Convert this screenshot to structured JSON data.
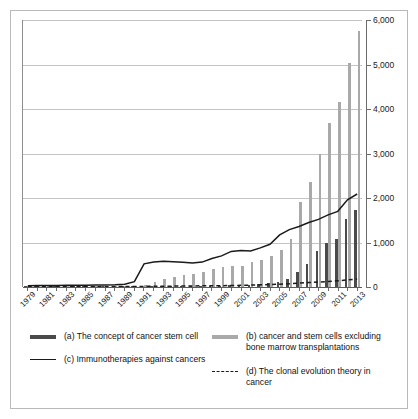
{
  "chart_data": {
    "type": "bar",
    "title": "",
    "subtitle": "",
    "xlabel": "",
    "ylabel": "",
    "ylim": [
      0,
      6000
    ],
    "xlim": [
      1979,
      2013
    ],
    "grid": true,
    "legend_position": "bottom",
    "y_ticks": [
      0,
      1000,
      2000,
      3000,
      4000,
      5000,
      6000
    ],
    "y_tick_labels": [
      "0",
      "1,000",
      "2,000",
      "3,000",
      "4,000",
      "5,000",
      "6,000"
    ],
    "x": [
      1979,
      1980,
      1981,
      1982,
      1983,
      1984,
      1985,
      1986,
      1987,
      1988,
      1989,
      1990,
      1991,
      1992,
      1993,
      1994,
      1995,
      1996,
      1997,
      1998,
      1999,
      2000,
      2001,
      2002,
      2003,
      2004,
      2005,
      2006,
      2007,
      2008,
      2009,
      2010,
      2011,
      2012,
      2013
    ],
    "x_tick_labels": [
      "1979",
      "1981",
      "1983",
      "1985",
      "1987",
      "1989",
      "1991",
      "1993",
      "1995",
      "1997",
      "1999",
      "2001",
      "2003",
      "2005",
      "2007",
      "2009",
      "2011",
      "2013"
    ],
    "series": [
      {
        "key": "a",
        "name": "(a) The concept of cancer stem cell",
        "render": "bar",
        "color": "#4a4a4a",
        "values": [
          2,
          2,
          3,
          3,
          4,
          4,
          5,
          5,
          6,
          7,
          8,
          10,
          12,
          14,
          16,
          18,
          20,
          22,
          25,
          28,
          32,
          36,
          42,
          50,
          62,
          80,
          120,
          180,
          330,
          520,
          800,
          1000,
          1080,
          1520,
          1720
        ]
      },
      {
        "key": "b",
        "name": "(b) cancer and stem cells excluding bone marrow transplantations",
        "render": "bar",
        "color": "#a9a9a9",
        "values": [
          6,
          7,
          8,
          9,
          10,
          11,
          12,
          13,
          14,
          16,
          18,
          22,
          40,
          120,
          170,
          230,
          260,
          300,
          330,
          400,
          440,
          470,
          480,
          560,
          610,
          700,
          840,
          1080,
          1900,
          2350,
          3000,
          3680,
          4150,
          5030,
          5750
        ]
      },
      {
        "key": "c",
        "name": "(c) Immunotherapies against cancers",
        "render": "line",
        "style": "solid",
        "color": "#1a1a1a",
        "values": [
          30,
          32,
          34,
          36,
          38,
          40,
          42,
          44,
          46,
          50,
          60,
          120,
          520,
          560,
          580,
          570,
          555,
          540,
          560,
          640,
          700,
          800,
          820,
          810,
          880,
          960,
          1170,
          1290,
          1360,
          1450,
          1520,
          1620,
          1700,
          1960,
          2090
        ]
      },
      {
        "key": "d",
        "name": "(d) The clonal evolution theory in cancer",
        "render": "line",
        "style": "dashed",
        "color": "#1a1a1a",
        "values": [
          4,
          5,
          5,
          6,
          6,
          7,
          7,
          8,
          8,
          9,
          10,
          12,
          14,
          16,
          18,
          20,
          22,
          24,
          26,
          28,
          30,
          34,
          38,
          42,
          48,
          55,
          62,
          72,
          88,
          100,
          112,
          124,
          140,
          160,
          180
        ]
      }
    ]
  },
  "legend": {
    "items": [
      {
        "key": "a",
        "swatch": "sw-a",
        "label": "(a) The concept of cancer stem cell"
      },
      {
        "key": "b",
        "swatch": "sw-b",
        "label": "(b) cancer and stem cells excluding bone marrow transplantations"
      },
      {
        "key": "c",
        "swatch": "sw-c",
        "label": "(c) Immunotherapies against cancers"
      },
      {
        "key": "d",
        "swatch": "sw-d",
        "label": "(d) The clonal evolution theory in cancer"
      }
    ]
  },
  "colors": {
    "series_a": "#4a4a4a",
    "series_b": "#a9a9a9",
    "line": "#1a1a1a",
    "gridline": "#c4c4c4",
    "axis": "#6b6b6b",
    "border": "#b9b9b9",
    "background": "#ffffff"
  }
}
